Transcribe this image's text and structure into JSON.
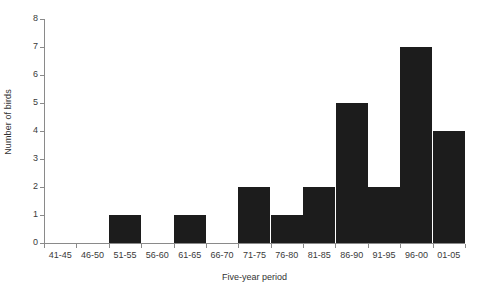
{
  "chart_data": {
    "type": "bar",
    "title": "",
    "subtitle": "",
    "xlabel": "Five-year period",
    "ylabel": "Number of birds",
    "categories": [
      "41-45",
      "46-50",
      "51-55",
      "56-60",
      "61-65",
      "66-70",
      "71-75",
      "76-80",
      "81-85",
      "86-90",
      "91-95",
      "96-00",
      "01-05"
    ],
    "values": [
      0,
      0,
      1,
      0,
      1,
      0,
      2,
      1,
      2,
      5,
      2,
      7,
      4
    ],
    "ylim": [
      0,
      8
    ],
    "yticks": [
      0,
      1,
      2,
      3,
      4,
      5,
      6,
      7,
      8
    ],
    "ytick_labels": [
      "0",
      "1",
      "2",
      "3",
      "4",
      "5",
      "6",
      "7",
      "8"
    ],
    "grid": false,
    "legend": false,
    "bar_color": "#1c1c1c",
    "axis_color": "#8a8a8a",
    "background_color": "#ffffff"
  }
}
